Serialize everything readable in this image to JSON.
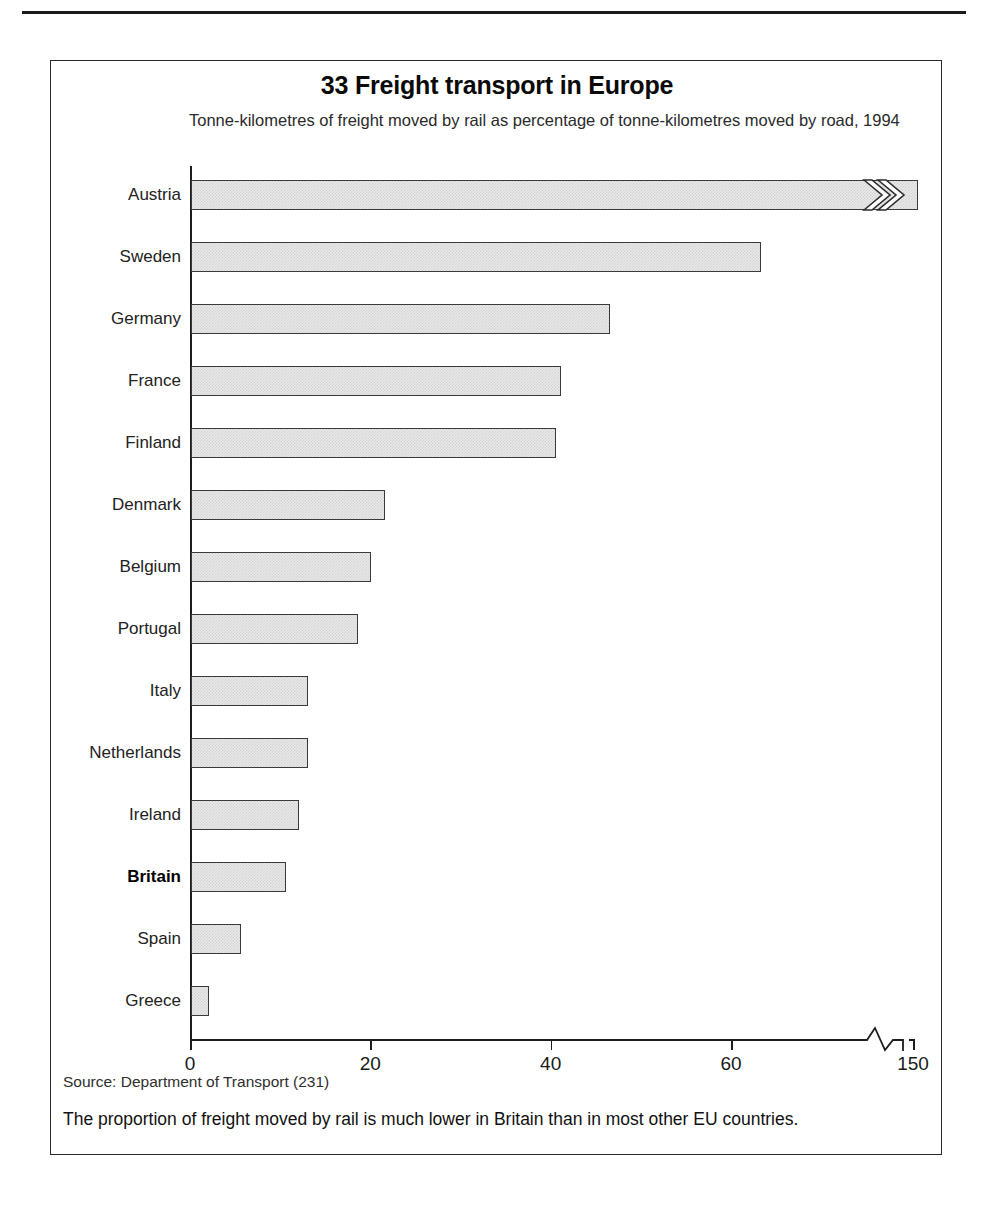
{
  "figure": {
    "title": "33 Freight transport in Europe",
    "subtitle": "Tonne-kilometres of freight moved by rail as percentage of tonne-kilometres moved by road, 1994",
    "source": "Source: Department of Transport (231)",
    "caption": "The proportion of freight moved by rail is much lower in Britain than in most other EU countries."
  },
  "axis": {
    "ticks": [
      {
        "label": "0",
        "value": 0
      },
      {
        "label": "20",
        "value": 20
      },
      {
        "label": "40",
        "value": 40
      },
      {
        "label": "60",
        "value": 60
      },
      {
        "label": "150",
        "value": 150
      }
    ],
    "break_between": [
      60,
      150
    ],
    "has_axis_break": true
  },
  "colors": {
    "bar_fill": "#e8e8e8",
    "bar_stroke": "#3a3a3a",
    "axis": "#1d1d1d",
    "frame": "#2b2b2b",
    "text": "#111111"
  },
  "chart_data": {
    "type": "bar",
    "orientation": "horizontal",
    "title": "33 Freight transport in Europe",
    "subtitle": "Tonne-kilometres of freight moved by rail as percentage of tonne-kilometres moved by road, 1994",
    "xlabel": "",
    "ylabel": "",
    "xlim": [
      0,
      150
    ],
    "xticks": [
      0,
      20,
      40,
      60,
      150
    ],
    "xticklabels": [
      "0",
      "20",
      "40",
      "60",
      "150"
    ],
    "axis_break": {
      "from": 60,
      "to": 150,
      "note": "x-axis is broken between 60 and 150"
    },
    "grid": false,
    "legend": null,
    "highlight": "Britain",
    "categories": [
      "Austria",
      "Sweden",
      "Germany",
      "France",
      "Finland",
      "Denmark",
      "Belgium",
      "Portugal",
      "Italy",
      "Netherlands",
      "Ireland",
      "Britain",
      "Spain",
      "Greece"
    ],
    "values": [
      152,
      74.5,
      46.5,
      41,
      40.5,
      21.5,
      20,
      18.5,
      13,
      13,
      12,
      10.5,
      5.5,
      2
    ],
    "bars": [
      {
        "category": "Austria",
        "value": 152,
        "broken": true,
        "highlight": false
      },
      {
        "category": "Sweden",
        "value": 74.5,
        "broken": false,
        "highlight": false
      },
      {
        "category": "Germany",
        "value": 46.5,
        "broken": false,
        "highlight": false
      },
      {
        "category": "France",
        "value": 41,
        "broken": false,
        "highlight": false
      },
      {
        "category": "Finland",
        "value": 40.5,
        "broken": false,
        "highlight": false
      },
      {
        "category": "Denmark",
        "value": 21.5,
        "broken": false,
        "highlight": false
      },
      {
        "category": "Belgium",
        "value": 20,
        "broken": false,
        "highlight": false
      },
      {
        "category": "Portugal",
        "value": 18.5,
        "broken": false,
        "highlight": false
      },
      {
        "category": "Italy",
        "value": 13,
        "broken": false,
        "highlight": false
      },
      {
        "category": "Netherlands",
        "value": 13,
        "broken": false,
        "highlight": false
      },
      {
        "category": "Ireland",
        "value": 12,
        "broken": false,
        "highlight": false
      },
      {
        "category": "Britain",
        "value": 10.5,
        "broken": false,
        "highlight": true
      },
      {
        "category": "Spain",
        "value": 5.5,
        "broken": false,
        "highlight": false
      },
      {
        "category": "Greece",
        "value": 2,
        "broken": false,
        "highlight": false
      }
    ]
  }
}
